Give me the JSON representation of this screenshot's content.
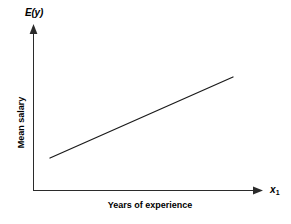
{
  "chart_data": {
    "type": "line",
    "title": "",
    "subtitle": "",
    "xlabel": "Years of experience",
    "ylabel": "Mean salary",
    "y_axis_symbol": "E(y)",
    "x_axis_symbol": "x",
    "x_axis_symbol_subscript": "1",
    "grid": false,
    "legend": "none",
    "axis_style": "arrowed",
    "xlim": [
      0,
      1
    ],
    "ylim": [
      0,
      1
    ],
    "x_tick_labels": [],
    "y_tick_labels": [],
    "annotations": [],
    "series": [
      {
        "name": "Mean salary line",
        "style": "straight-line",
        "x": [
          0.074,
          0.874
        ],
        "y": [
          0.195,
          0.689
        ],
        "points_px": [
          {
            "x": 50,
            "y": 158
          },
          {
            "x": 233,
            "y": 77
          }
        ]
      }
    ]
  },
  "figure": {
    "background_color": "#ffffff",
    "line_color": "#1a1a1a",
    "axis_color": "#2b2b2b",
    "text_color": "#000000"
  },
  "icons": {
    "y_axis_arrow": "arrow-up-icon",
    "x_axis_arrow": "arrow-right-icon"
  }
}
